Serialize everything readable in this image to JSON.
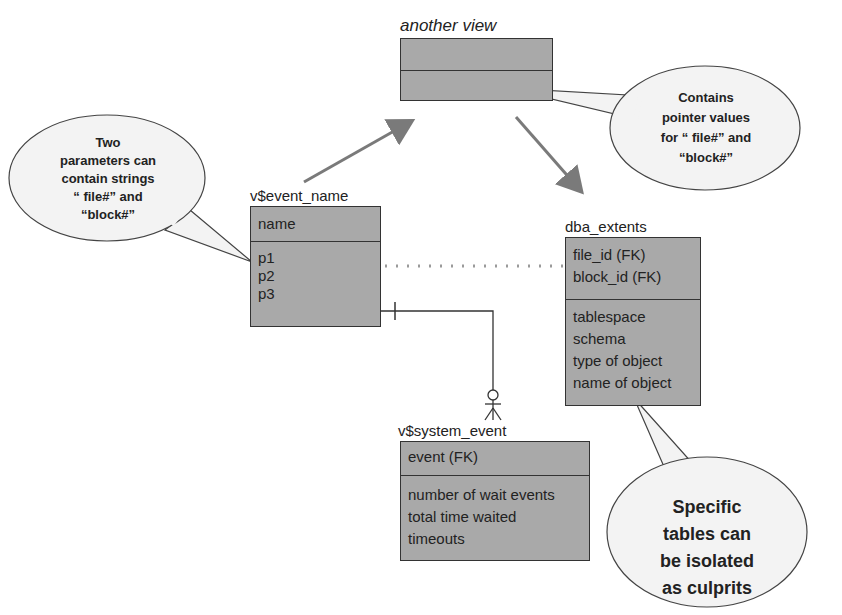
{
  "diagram": {
    "entities": {
      "another_view": {
        "label": "another view",
        "key_rows": [],
        "attr_rows": []
      },
      "v_event_name": {
        "label": "v$event_name",
        "key_rows": [
          "name"
        ],
        "attr_rows": [
          "p1",
          "p2",
          "p3"
        ]
      },
      "dba_extents": {
        "label": "dba_extents",
        "key_rows": [
          "file_id (FK)",
          "block_id (FK)"
        ],
        "attr_rows": [
          "tablespace",
          "schema",
          "type of object",
          "name of object"
        ]
      },
      "v_system_event": {
        "label": "v$system_event",
        "key_rows": [
          "event (FK)"
        ],
        "attr_rows": [
          "number of wait events",
          "total time waited",
          "timeouts"
        ]
      }
    },
    "callouts": {
      "left": {
        "lines": [
          "Two",
          "parameters can",
          "contain strings",
          "“ file#” and",
          "“block#”"
        ]
      },
      "top_right": {
        "lines": [
          "Contains",
          "pointer values",
          "for “ file#” and",
          "“block#”"
        ]
      },
      "bottom_right": {
        "lines": [
          "Specific",
          "tables can",
          "be isolated",
          "as culprits"
        ]
      }
    },
    "relationships": [
      {
        "from": "v$event_name",
        "to": "another view",
        "type": "arrow"
      },
      {
        "from": "another view",
        "to": "dba_extents",
        "type": "arrow"
      },
      {
        "from": "v$event_name.p1/p2",
        "to": "dba_extents.file_id/block_id",
        "type": "dotted"
      },
      {
        "from": "v$event_name",
        "to": "v$system_event",
        "type": "one-to-zero-or-many"
      }
    ],
    "colors": {
      "entity_fill": "#a9a9a9",
      "entity_border": "#333333",
      "arrow": "#7a7a7a",
      "callout_fill": "#f3f3f3",
      "dotted_line": "#9a9a9a"
    }
  }
}
